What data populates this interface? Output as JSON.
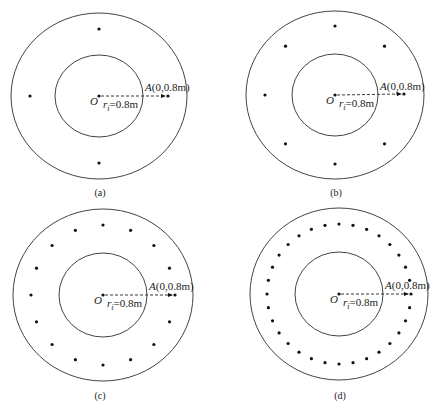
{
  "figure": {
    "panels": [
      {
        "id": "a",
        "caption": "(a)",
        "center": [
          99,
          96
        ],
        "outer": [
          88,
          83
        ],
        "inner": [
          44,
          41
        ],
        "ring_radius": [
          69,
          67
        ],
        "source_count": 4,
        "point_A": [
          168,
          96
        ],
        "origin_label": "O",
        "radius_label": "r",
        "radius_sub": "i",
        "radius_value": "=0.8m",
        "point_label_italic": "A",
        "point_label_rest": "(0,0.8m)",
        "caption_pos": [
          100,
          196
        ]
      },
      {
        "id": "b",
        "caption": "(b)",
        "center": [
          335,
          95
        ],
        "outer": [
          89,
          84
        ],
        "inner": [
          43,
          41
        ],
        "ring_radius": [
          70,
          69
        ],
        "source_count": 8,
        "point_A": [
          404,
          94
        ],
        "origin_label": "O",
        "radius_label": "r",
        "radius_sub": "i",
        "radius_value": "=0.8m",
        "point_label_italic": "A",
        "point_label_rest": "(0,0.8m)",
        "caption_pos": [
          336,
          196
        ]
      },
      {
        "id": "c",
        "caption": "(c)",
        "center": [
          103,
          295
        ],
        "outer": [
          90,
          86
        ],
        "inner": [
          44,
          42
        ],
        "ring_radius": [
          72,
          70
        ],
        "source_count": 16,
        "point_A": [
          175,
          295
        ],
        "origin_label": "O",
        "radius_label": "r",
        "radius_sub": "i",
        "radius_value": "=0.8m",
        "point_label_italic": "A",
        "point_label_rest": "(0,0.8m)",
        "caption_pos": [
          100,
          399
        ]
      },
      {
        "id": "d",
        "caption": "(d)",
        "center": [
          339,
          294
        ],
        "outer": [
          89,
          86
        ],
        "inner": [
          44,
          42
        ],
        "ring_radius": [
          72,
          70
        ],
        "source_count": 32,
        "point_A": [
          411,
          294
        ],
        "origin_label": "O",
        "radius_label": "r",
        "radius_sub": "i",
        "radius_value": "=0.8m",
        "point_label_italic": "A",
        "point_label_rest": "(0,0.8m)",
        "caption_pos": [
          340,
          399
        ]
      }
    ],
    "colors": {
      "stroke": "#444444",
      "dot": "#111111",
      "text": "#222222"
    }
  }
}
